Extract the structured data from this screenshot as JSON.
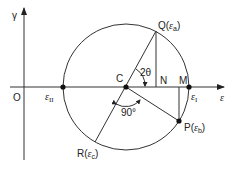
{
  "diagram": {
    "type": "mohr-circle-strain",
    "axes": {
      "y_label": "γ",
      "x_label": "ε",
      "origin_label": "O"
    },
    "points": {
      "center": "C",
      "Q": "Q(",
      "Q_sub": "ε",
      "Q_subsub": "a",
      "P": "P(",
      "P_sub": "ε",
      "P_subsub": "b",
      "R": "R(",
      "R_sub": "ε",
      "R_subsub": "c",
      "N": "N",
      "M": "M",
      "eps_I": "ε",
      "eps_I_sub": "I",
      "eps_II": "ε",
      "eps_II_sub": "II",
      "close": ")"
    },
    "angles": {
      "two_theta": "2θ",
      "right_angle": "90°"
    },
    "colors": {
      "line": "#333333",
      "background": "#ffffff"
    }
  }
}
